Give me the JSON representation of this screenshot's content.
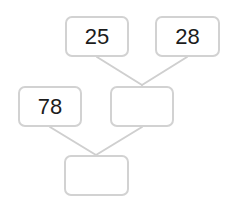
{
  "diagram": {
    "type": "number-bond-tree",
    "colors": {
      "box_border": "#d2d2d2",
      "connector": "#cfcfcf",
      "text": "#1c1c1c",
      "background": "#ffffff"
    },
    "nodes": {
      "top_left": {
        "value": "25"
      },
      "top_right": {
        "value": "28"
      },
      "mid_left": {
        "value": "78"
      },
      "mid_right": {
        "value": ""
      },
      "bottom": {
        "value": ""
      }
    },
    "edges": [
      {
        "from": "top_left",
        "to": "mid_right"
      },
      {
        "from": "top_right",
        "to": "mid_right"
      },
      {
        "from": "mid_left",
        "to": "bottom"
      },
      {
        "from": "mid_right",
        "to": "bottom"
      }
    ]
  }
}
